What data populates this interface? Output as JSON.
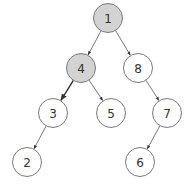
{
  "diagram": {
    "type": "binary-tree",
    "style": {
      "highlight_fill": "#d3d3d3",
      "normal_fill": "#ffffff",
      "stroke": "#7a7a7a",
      "edge_color": "#555555",
      "node_radius": 14.5
    },
    "nodes": [
      {
        "id": "n1",
        "label": "1",
        "x": 108,
        "y": 18,
        "highlighted": true
      },
      {
        "id": "n4",
        "label": "4",
        "x": 81,
        "y": 68,
        "highlighted": true
      },
      {
        "id": "n8",
        "label": "8",
        "x": 138,
        "y": 68,
        "highlighted": false
      },
      {
        "id": "n3",
        "label": "3",
        "x": 53,
        "y": 113,
        "highlighted": false
      },
      {
        "id": "n5",
        "label": "5",
        "x": 111,
        "y": 113,
        "highlighted": false
      },
      {
        "id": "n7",
        "label": "7",
        "x": 167,
        "y": 113,
        "highlighted": false
      },
      {
        "id": "n2",
        "label": "2",
        "x": 27,
        "y": 162,
        "highlighted": false
      },
      {
        "id": "n6",
        "label": "6",
        "x": 140,
        "y": 162,
        "highlighted": false
      }
    ],
    "edges": [
      {
        "from": "n1",
        "to": "n4",
        "highlighted": false
      },
      {
        "from": "n1",
        "to": "n8",
        "highlighted": false
      },
      {
        "from": "n4",
        "to": "n3",
        "highlighted": true
      },
      {
        "from": "n4",
        "to": "n5",
        "highlighted": false
      },
      {
        "from": "n8",
        "to": "n7",
        "highlighted": false
      },
      {
        "from": "n3",
        "to": "n2",
        "highlighted": false
      },
      {
        "from": "n7",
        "to": "n6",
        "highlighted": false
      }
    ]
  }
}
